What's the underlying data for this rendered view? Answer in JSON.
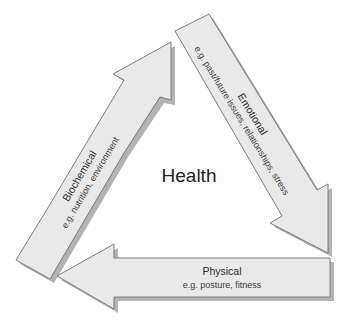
{
  "diagram": {
    "center_label": "Health",
    "arrows": [
      {
        "id": "biochemical",
        "title": "Biochemical",
        "subtitle": "e.g. nutrition, environment",
        "direction": "up-right"
      },
      {
        "id": "emotional",
        "title": "Emotional",
        "subtitle": "e.g. past/future issues, relationships, stress",
        "direction": "down-right"
      },
      {
        "id": "physical",
        "title": "Physical",
        "subtitle": "e.g. posture, fitness",
        "direction": "left"
      }
    ],
    "colors": {
      "arrow_fill": "#e9e9e9",
      "arrow_stroke": "#6f6f6f",
      "shadow": "#9a9a9a",
      "text": "#2a2a2a"
    }
  }
}
